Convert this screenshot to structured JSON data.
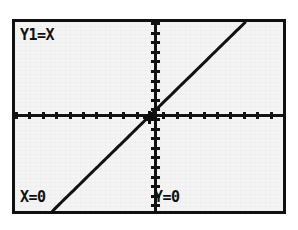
{
  "device": {
    "kind": "graphing-calculator-screen",
    "mode": "trace"
  },
  "screen": {
    "background_color": "#f4f4f4",
    "ink_color": "#101010",
    "border_color": "#101010"
  },
  "readouts": {
    "function_label": "Y1=X",
    "x_label": "X=0",
    "y_label": "Y=0"
  },
  "chart_data": {
    "type": "line",
    "title": "Y1=X",
    "xlabel": "X",
    "ylabel": "Y",
    "grid": false,
    "legend": null,
    "axes": {
      "x_axis_visible": true,
      "y_axis_visible": true,
      "x_tick_count": 20,
      "y_tick_count": 20,
      "x_tick_spacing": 1,
      "y_tick_spacing": 1
    },
    "xlim": [
      -10,
      10
    ],
    "ylim": [
      -7.2,
      7.2
    ],
    "series": [
      {
        "name": "Y1=X",
        "expression": "y = x",
        "slope": 1,
        "intercept": 0,
        "x": [
          -10,
          -8,
          -6,
          -4,
          -2,
          0,
          2,
          4,
          6,
          8,
          10
        ],
        "values": [
          -10,
          -8,
          -6,
          -4,
          -2,
          0,
          2,
          4,
          6,
          8,
          10
        ]
      }
    ],
    "annotations": [
      {
        "name": "trace-cursor",
        "x": 0,
        "y": 0,
        "label": "X=0  Y=0"
      }
    ]
  },
  "geometry": {
    "origin_x_pct": 52.2,
    "origin_y_pct": 49.0,
    "line_visible_x_start_pct": 12.0,
    "line_visible_x_end_pct": 100.0
  }
}
